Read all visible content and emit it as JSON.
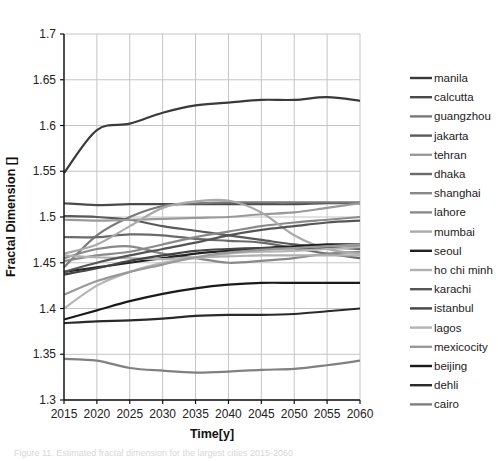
{
  "chart_data": {
    "type": "line",
    "title": "",
    "xlabel": "Time[y]",
    "ylabel": "Fractal Dimension []",
    "x": [
      2015,
      2020,
      2025,
      2030,
      2035,
      2040,
      2045,
      2050,
      2055,
      2060
    ],
    "xticks": [
      "2015",
      "2020",
      "2025",
      "2030",
      "2035",
      "2040",
      "2045",
      "2050",
      "2055",
      "2060"
    ],
    "yticks": [
      "1.3",
      "1.35",
      "1.4",
      "1.45",
      "1.5",
      "1.55",
      "1.6",
      "1.65",
      "1.7"
    ],
    "ylim": [
      1.3,
      1.7
    ],
    "xlim": [
      2015,
      2060
    ],
    "grid": true,
    "legend_position": "right",
    "series": [
      {
        "name": "manila",
        "color": "#3a3a3a",
        "values": [
          1.548,
          1.595,
          1.602,
          1.614,
          1.622,
          1.625,
          1.628,
          1.628,
          1.631,
          1.627
        ]
      },
      {
        "name": "calcutta",
        "color": "#4a4a4a",
        "values": [
          1.515,
          1.513,
          1.514,
          1.514,
          1.514,
          1.514,
          1.514,
          1.514,
          1.515,
          1.515
        ]
      },
      {
        "name": "guangzhou",
        "color": "#7a7a7a",
        "values": [
          1.445,
          1.48,
          1.5,
          1.512,
          1.515,
          1.516,
          1.516,
          1.516,
          1.516,
          1.516
        ]
      },
      {
        "name": "jakarta",
        "color": "#5a5a5a",
        "values": [
          1.501,
          1.5,
          1.497,
          1.49,
          1.485,
          1.48,
          1.475,
          1.47,
          1.467,
          1.465
        ]
      },
      {
        "name": "tehran",
        "color": "#9a9a9a",
        "values": [
          1.497,
          1.496,
          1.497,
          1.498,
          1.499,
          1.5,
          1.503,
          1.505,
          1.51,
          1.515
        ]
      },
      {
        "name": "dhaka",
        "color": "#6a6a6a",
        "values": [
          1.478,
          1.478,
          1.481,
          1.48,
          1.476,
          1.474,
          1.472,
          1.466,
          1.46,
          1.455
        ]
      },
      {
        "name": "shanghai",
        "color": "#888888",
        "values": [
          1.455,
          1.465,
          1.468,
          1.46,
          1.455,
          1.45,
          1.452,
          1.455,
          1.46,
          1.462
        ]
      },
      {
        "name": "lahore",
        "color": "#8a8a8a",
        "values": [
          1.452,
          1.458,
          1.462,
          1.47,
          1.478,
          1.484,
          1.49,
          1.494,
          1.497,
          1.5
        ]
      },
      {
        "name": "mumbai",
        "color": "#aaaaaa",
        "values": [
          1.46,
          1.47,
          1.49,
          1.51,
          1.517,
          1.518,
          1.505,
          1.48,
          1.465,
          1.46
        ]
      },
      {
        "name": "seoul",
        "color": "#222222",
        "values": [
          1.44,
          1.445,
          1.45,
          1.455,
          1.46,
          1.463,
          1.466,
          1.468,
          1.47,
          1.47
        ]
      },
      {
        "name": "ho chi minh",
        "color": "#b0b0b0",
        "values": [
          1.458,
          1.456,
          1.455,
          1.454,
          1.456,
          1.457,
          1.458,
          1.458,
          1.458,
          1.458
        ]
      },
      {
        "name": "karachi",
        "color": "#555555",
        "values": [
          1.44,
          1.45,
          1.458,
          1.465,
          1.472,
          1.48,
          1.486,
          1.49,
          1.494,
          1.496
        ]
      },
      {
        "name": "istanbul",
        "color": "#444444",
        "values": [
          1.437,
          1.444,
          1.452,
          1.458,
          1.463,
          1.465,
          1.466,
          1.466,
          1.466,
          1.467
        ]
      },
      {
        "name": "lagos",
        "color": "#b5b5b5",
        "values": [
          1.4,
          1.425,
          1.44,
          1.45,
          1.455,
          1.46,
          1.462,
          1.463,
          1.465,
          1.467
        ]
      },
      {
        "name": "mexicocity",
        "color": "#999999",
        "values": [
          1.415,
          1.43,
          1.44,
          1.448,
          1.456,
          1.461,
          1.464,
          1.466,
          1.468,
          1.47
        ]
      },
      {
        "name": "beijing",
        "color": "#1a1a1a",
        "values": [
          1.388,
          1.398,
          1.408,
          1.416,
          1.422,
          1.426,
          1.428,
          1.428,
          1.428,
          1.428
        ]
      },
      {
        "name": "dehli",
        "color": "#2a2a2a",
        "values": [
          1.384,
          1.386,
          1.387,
          1.389,
          1.392,
          1.393,
          1.393,
          1.394,
          1.397,
          1.4
        ]
      },
      {
        "name": "cairo",
        "color": "#808080",
        "values": [
          1.345,
          1.343,
          1.335,
          1.332,
          1.33,
          1.331,
          1.333,
          1.334,
          1.338,
          1.343
        ]
      }
    ]
  },
  "layout": {
    "plot": {
      "left": 64,
      "top": 34,
      "right": 360,
      "bottom": 400
    },
    "legend": {
      "x": 410,
      "y": 78,
      "row_height": 19.2,
      "swatch": 22
    }
  },
  "caption": "Figure 11. Estimated fractal dimension for the largest cities 2015-2060"
}
